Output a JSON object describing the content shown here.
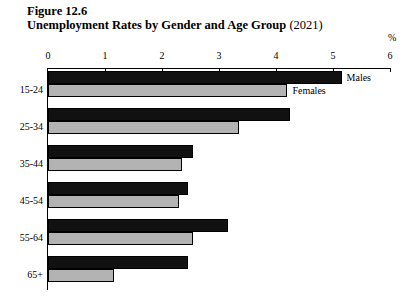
{
  "figure": {
    "number": "Figure 12.6",
    "title": "Unemployment Rates by Gender and Age Group",
    "year": "(2021)",
    "unit_label": "%"
  },
  "annotations": {
    "males_note": "Males",
    "females_note": "Females"
  },
  "chart_data": {
    "type": "bar",
    "orientation": "horizontal",
    "title": "Unemployment Rates by Gender and Age Group (2021)",
    "xlabel": "%",
    "ylabel": "",
    "xlim": [
      0,
      6
    ],
    "xticks": [
      "0",
      "1",
      "2",
      "3",
      "4",
      "5",
      "6"
    ],
    "grid": false,
    "legend": "inline-annotation",
    "categories": [
      "15-24",
      "25-34",
      "35-44",
      "45-54",
      "55-64",
      "65+"
    ],
    "series": [
      {
        "name": "Males",
        "color": "#111111",
        "values": [
          5.15,
          4.25,
          2.55,
          2.45,
          3.15,
          2.45
        ]
      },
      {
        "name": "Females",
        "color": "#b3b3b3",
        "values": [
          4.2,
          3.35,
          2.35,
          2.3,
          2.55,
          1.15
        ]
      }
    ]
  }
}
